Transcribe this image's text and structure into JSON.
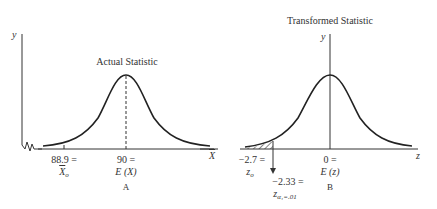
{
  "panel_a": {
    "title": "Actual Statistic",
    "y_axis_label": "y",
    "tick_left_value": "88.9 =",
    "tick_left_symbol": "X",
    "tick_left_subscript": "o",
    "tick_center_value": "90 =",
    "tick_center_symbol": "E (X)",
    "caption": "A"
  },
  "panel_b": {
    "title": "Transformed Statistic",
    "y_axis_label": "y",
    "x_axis_label": "z",
    "left_axis_label": "X",
    "tick_zo_value": "−2.7 =",
    "tick_zo_symbol": "z",
    "tick_zo_subscript": "o",
    "tick_crit_value": "−2.33 =",
    "tick_crit_symbol": "z",
    "tick_crit_subscript": "α₁=.01",
    "tick_center_value": "0 =",
    "tick_center_symbol": "E (z)",
    "caption": "B"
  }
}
